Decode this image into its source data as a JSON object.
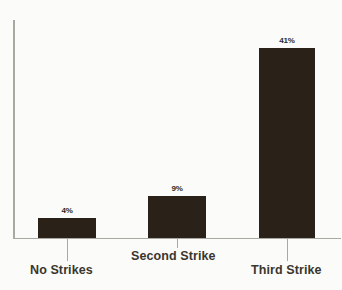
{
  "chart_data": {
    "type": "bar",
    "title": "",
    "subtitle": "",
    "xlabel": "",
    "ylabel": "",
    "categories": [
      "No Strikes",
      "Second Strike",
      "Third Strike"
    ],
    "values": [
      4,
      9,
      41
    ],
    "value_labels": [
      "4%",
      "9%",
      "41%"
    ],
    "ylim": [
      0,
      47
    ],
    "grid": false,
    "legend": false,
    "legend_position": "none",
    "axis_tick_labels": [],
    "bar_color": "#2a2218",
    "axis_color": "#a9a9a1",
    "background_color": "#fbfbf9",
    "label_color": "#3a362e"
  },
  "bars": [
    {
      "category": "No Strikes",
      "value_label": "4%",
      "left": 38,
      "width": 58,
      "top": 218,
      "height": 20,
      "label_left": 38,
      "label_top": 206,
      "tick_left": 67,
      "tick_top": 239,
      "tick_height": 22,
      "cat_left": 30,
      "cat_top": 263
    },
    {
      "category": "Second Strike",
      "value_label": "9%",
      "left": 148,
      "width": 58,
      "top": 196,
      "height": 42,
      "label_left": 148,
      "label_top": 184,
      "tick_left": 177,
      "tick_top": 239,
      "tick_height": 9,
      "cat_left": 131,
      "cat_top": 249
    },
    {
      "category": "Third Strike",
      "value_label": "41%",
      "left": 259,
      "width": 56,
      "top": 48,
      "height": 190,
      "label_left": 259,
      "label_top": 36,
      "tick_left": 287,
      "tick_top": 239,
      "tick_height": 22,
      "cat_left": 251,
      "cat_top": 263
    }
  ]
}
